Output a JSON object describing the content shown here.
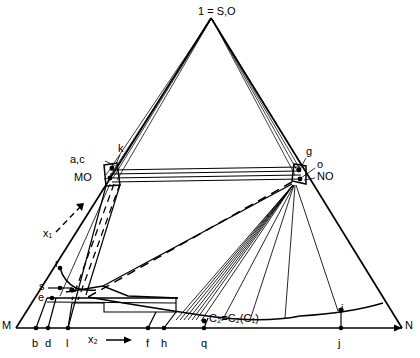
{
  "figure": {
    "type": "geometric-ray-diagram",
    "background_color": "#ffffff",
    "line_color": "#000000",
    "apex_label": "1 = S,O",
    "axis_labels": {
      "x1": "x₁",
      "x2": "x₂"
    },
    "curve_annotation": "C₂=C₂(C₁)",
    "node_labels": {
      "left_node_upper": "a,c",
      "left_node_k": "k",
      "left_node_name": "MO",
      "right_node_g": "g",
      "right_node_o": "o",
      "right_node_name": "NO"
    },
    "left_cluster_labels": [
      "r",
      "s",
      "e"
    ],
    "baseline_endpoints": {
      "left": "M",
      "right": "N"
    },
    "baseline_points": [
      "b",
      "d",
      "l",
      "f",
      "h",
      "q",
      "j"
    ],
    "curve_points": [
      "i"
    ]
  },
  "labels": [
    {
      "id": "apex",
      "text": "1 = S,O",
      "x": 198,
      "y": 8,
      "name": "apex-label"
    },
    {
      "id": "ac",
      "text": "a,c",
      "x": 88,
      "y": 158,
      "name": "node-label-ac"
    },
    {
      "id": "k",
      "text": "k",
      "x": 119,
      "y": 147,
      "name": "node-label-k"
    },
    {
      "id": "mo",
      "text": "MO",
      "x": 86,
      "y": 176,
      "name": "node-label-mo"
    },
    {
      "id": "g",
      "text": "g",
      "x": 306,
      "y": 150,
      "name": "node-label-g"
    },
    {
      "id": "o",
      "text": "o",
      "x": 317,
      "y": 163,
      "name": "node-label-o"
    },
    {
      "id": "no",
      "text": "NO",
      "x": 317,
      "y": 174,
      "name": "node-label-no"
    },
    {
      "id": "r",
      "text": "r",
      "x": 55,
      "y": 265,
      "name": "point-label-r"
    },
    {
      "id": "s",
      "text": "s",
      "x": 41,
      "y": 284,
      "name": "point-label-s"
    },
    {
      "id": "e",
      "text": "e",
      "x": 40,
      "y": 297,
      "name": "point-label-e"
    },
    {
      "id": "M",
      "text": "M",
      "x": 4,
      "y": 320,
      "name": "baseline-label-m"
    },
    {
      "id": "N",
      "text": "N",
      "x": 404,
      "y": 320,
      "name": "baseline-label-n"
    },
    {
      "id": "b",
      "text": "b",
      "x": 33,
      "y": 341,
      "name": "baseline-label-b"
    },
    {
      "id": "d",
      "text": "d",
      "x": 46,
      "y": 341,
      "name": "baseline-label-d"
    },
    {
      "id": "l",
      "text": "l",
      "x": 65,
      "y": 341,
      "name": "baseline-label-l"
    },
    {
      "id": "f",
      "text": "f",
      "x": 145,
      "y": 341,
      "name": "baseline-label-f"
    },
    {
      "id": "h",
      "text": "h",
      "x": 161,
      "y": 341,
      "name": "baseline-label-h"
    },
    {
      "id": "q",
      "text": "q",
      "x": 201,
      "y": 341,
      "name": "baseline-label-q"
    },
    {
      "id": "j",
      "text": "j",
      "x": 338,
      "y": 341,
      "name": "baseline-label-j"
    },
    {
      "id": "i",
      "text": "i",
      "x": 340,
      "y": 310,
      "name": "curve-label-i"
    }
  ]
}
